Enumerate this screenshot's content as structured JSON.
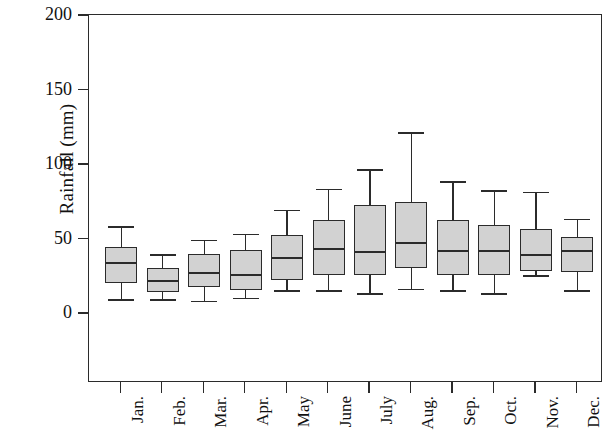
{
  "chart_data": {
    "type": "box",
    "title": "",
    "xlabel": "",
    "ylabel": "Rainfall (mm)",
    "ylim": [
      0,
      200
    ],
    "yticks": [
      0,
      50,
      100,
      150,
      200
    ],
    "ytick_labels": [
      "0",
      "50",
      "100",
      "150",
      "200"
    ],
    "grid": false,
    "legend": "none",
    "categories": [
      "Jan.",
      "Feb.",
      "Mar.",
      "Apr.",
      "May",
      "June",
      "July",
      "Aug.",
      "Sep.",
      "Oct.",
      "Nov.",
      "Dec."
    ],
    "boxes": [
      {
        "label": "Jan.",
        "whisker_low": 10,
        "q1": 21,
        "median": 35,
        "q3": 45,
        "whisker_high": 59
      },
      {
        "label": "Feb.",
        "whisker_low": 10,
        "q1": 15,
        "median": 23,
        "q3": 31,
        "whisker_high": 40
      },
      {
        "label": "Mar.",
        "whisker_low": 9,
        "q1": 18,
        "median": 28,
        "q3": 40,
        "whisker_high": 50
      },
      {
        "label": "Apr.",
        "whisker_low": 11,
        "q1": 16,
        "median": 27,
        "q3": 43,
        "whisker_high": 54
      },
      {
        "label": "May",
        "whisker_low": 16,
        "q1": 23,
        "median": 38,
        "q3": 53,
        "whisker_high": 70
      },
      {
        "label": "June",
        "whisker_low": 16,
        "q1": 26,
        "median": 44,
        "q3": 63,
        "whisker_high": 84
      },
      {
        "label": "July",
        "whisker_low": 14,
        "q1": 26,
        "median": 42,
        "q3": 73,
        "whisker_high": 97
      },
      {
        "label": "Aug.",
        "whisker_low": 17,
        "q1": 31,
        "median": 48,
        "q3": 75,
        "whisker_high": 122
      },
      {
        "label": "Sep.",
        "whisker_low": 16,
        "q1": 26,
        "median": 43,
        "q3": 63,
        "whisker_high": 89
      },
      {
        "label": "Oct.",
        "whisker_low": 14,
        "q1": 26,
        "median": 43,
        "q3": 60,
        "whisker_high": 83
      },
      {
        "label": "Nov.",
        "whisker_low": 26,
        "q1": 29,
        "median": 40,
        "q3": 57,
        "whisker_high": 82
      },
      {
        "label": "Dec.",
        "whisker_low": 16,
        "q1": 28,
        "median": 43,
        "q3": 52,
        "whisker_high": 64
      }
    ],
    "colors": {
      "box_fill": "#d2d2d2",
      "line": "#2b2b2b",
      "background": "#ffffff",
      "text": "#111111"
    }
  }
}
